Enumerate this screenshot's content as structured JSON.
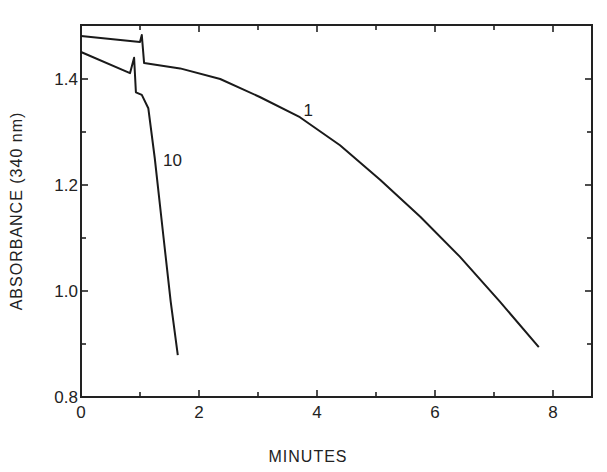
{
  "chart_data": {
    "type": "line",
    "title": "",
    "xlabel": "MINUTES",
    "ylabel": "ABSORBANCE (340 nm)",
    "xlim": [
      0,
      8.6
    ],
    "ylim": [
      0.8,
      1.5
    ],
    "xticks": [
      0,
      2,
      4,
      6,
      8
    ],
    "xtick_labels": [
      "0",
      "2",
      "4",
      "6",
      "8"
    ],
    "xminor_ticks": [
      1,
      3,
      5,
      7
    ],
    "yticks": [
      0.8,
      1.0,
      1.2,
      1.4
    ],
    "ytick_labels": [
      "0.8",
      "1.0",
      "1.2",
      "1.4"
    ],
    "yminor_ticks": [
      0.9,
      1.1,
      1.3
    ],
    "grid": false,
    "legend": "none (curves labeled inline)",
    "series": [
      {
        "name": "1",
        "label_position": {
          "x": 3.85,
          "y": 1.33
        },
        "x": [
          0,
          1.0,
          1.03,
          1.07,
          1.68,
          2.36,
          3.03,
          3.71,
          4.39,
          5.07,
          5.75,
          6.42,
          7.1,
          7.76
        ],
        "y": [
          1.481,
          1.47,
          1.483,
          1.43,
          1.42,
          1.4,
          1.366,
          1.328,
          1.275,
          1.21,
          1.14,
          1.065,
          0.98,
          0.894
        ]
      },
      {
        "name": "10",
        "label_position": {
          "x": 1.55,
          "y": 1.235
        },
        "x": [
          0,
          0.83,
          0.9,
          0.93,
          1.03,
          1.14,
          1.25,
          1.4,
          1.52,
          1.64
        ],
        "y": [
          1.451,
          1.411,
          1.44,
          1.375,
          1.37,
          1.345,
          1.25,
          1.1,
          0.98,
          0.879
        ]
      }
    ]
  }
}
